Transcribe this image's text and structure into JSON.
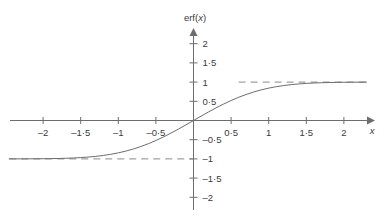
{
  "chart_data": {
    "type": "line",
    "title": "",
    "xlabel": "x",
    "ylabel": "erf(x)",
    "xlim": [
      -2.45,
      2.35
    ],
    "ylim": [
      -2.35,
      2.2
    ],
    "grid": false,
    "legend": null,
    "x_ticks": [
      -2,
      -1.5,
      -1,
      -0.5,
      0.5,
      1,
      1.5,
      2
    ],
    "x_tick_labels": [
      "–2",
      "–1·5",
      "–1",
      "–0·5",
      "0·5",
      "1",
      "1·5",
      "2"
    ],
    "y_ticks": [
      2,
      1.5,
      1,
      0.5,
      -0.5,
      -1,
      -1.5,
      -2
    ],
    "y_tick_labels": [
      "2",
      "1·5",
      "1",
      "0·5",
      "–0·5",
      "–1",
      "–1·5",
      "–2"
    ],
    "series": [
      {
        "name": "erf(x)",
        "style": "solid",
        "color": "#6d6d6d",
        "x": [
          -2.45,
          -2.3,
          -2.2,
          -2.1,
          -2.0,
          -1.9,
          -1.8,
          -1.7,
          -1.6,
          -1.5,
          -1.4,
          -1.3,
          -1.2,
          -1.1,
          -1.0,
          -0.9,
          -0.8,
          -0.7,
          -0.6,
          -0.5,
          -0.4,
          -0.3,
          -0.2,
          -0.1,
          0.0,
          0.1,
          0.2,
          0.3,
          0.4,
          0.5,
          0.6,
          0.7,
          0.8,
          0.9,
          1.0,
          1.1,
          1.2,
          1.3,
          1.4,
          1.5,
          1.6,
          1.7,
          1.8,
          1.9,
          2.0,
          2.1,
          2.2,
          2.3
        ],
        "y": [
          -0.9996,
          -0.9989,
          -0.9981,
          -0.997,
          -0.9953,
          -0.9928,
          -0.9891,
          -0.9838,
          -0.9763,
          -0.9661,
          -0.9523,
          -0.934,
          -0.9103,
          -0.8802,
          -0.8427,
          -0.7969,
          -0.7421,
          -0.6778,
          -0.6039,
          -0.5205,
          -0.4284,
          -0.3286,
          -0.2227,
          -0.1125,
          0.0,
          0.1125,
          0.2227,
          0.3286,
          0.4284,
          0.5205,
          0.6039,
          0.6778,
          0.7421,
          0.7969,
          0.8427,
          0.8802,
          0.9103,
          0.934,
          0.9523,
          0.9661,
          0.9763,
          0.9838,
          0.9891,
          0.9928,
          0.9953,
          0.997,
          0.9981,
          0.9989
        ]
      }
    ],
    "asymptotes": [
      {
        "name": "upper-asymptote",
        "value": 1,
        "style": "dashed",
        "color": "#8a8a8a",
        "x_start": 0.6,
        "x_end": 2.35
      },
      {
        "name": "lower-asymptote",
        "value": -1,
        "style": "dashed",
        "color": "#8a8a8a",
        "x_start": -2.45,
        "x_end": 0.0
      }
    ],
    "annotations": []
  },
  "figure": {
    "axis_color": "#6d6d6d",
    "text_color": "#3a3a3a",
    "background": "#ffffff"
  }
}
